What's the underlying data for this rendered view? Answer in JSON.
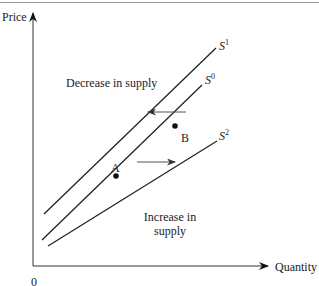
{
  "diagram": {
    "type": "supply shift diagram",
    "axes": {
      "y_label": "Price",
      "x_label": "Quantity",
      "origin_label": "0"
    },
    "curves": [
      {
        "name": "S",
        "superscript": "1"
      },
      {
        "name": "S",
        "superscript": "0"
      },
      {
        "name": "S",
        "superscript": "2"
      }
    ],
    "points": {
      "a": "A",
      "b": "B"
    },
    "annotations": {
      "decrease": "Decrease in supply",
      "increase_line1": "Increase in",
      "increase_line2": "supply"
    },
    "colors": {
      "line": "#222222",
      "arrow": "#555555"
    }
  }
}
